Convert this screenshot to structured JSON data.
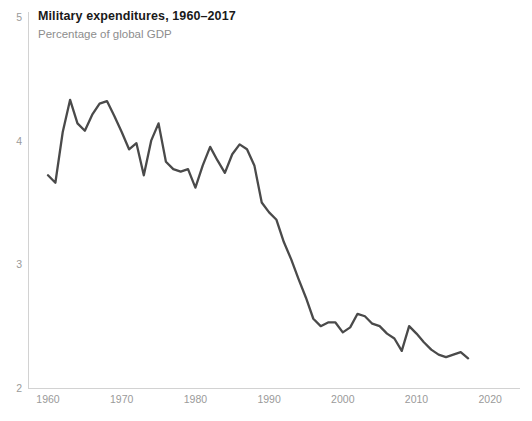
{
  "chart_data": {
    "type": "line",
    "title": "Military expenditures, 1960–2017",
    "subtitle": "Percentage of global GDP",
    "xlabel": "",
    "ylabel": "",
    "xlim": [
      1957,
      2022
    ],
    "ylim": [
      2,
      5
    ],
    "grid": false,
    "legend": null,
    "line_color": "#4a4a4a",
    "axis_color": "#d2d2d2",
    "tick_label_color": "#9a9a9a",
    "xticks": [
      1960,
      1970,
      1980,
      1990,
      2000,
      2010,
      2020
    ],
    "xtick_labels": [
      "1960",
      "1970",
      "1980",
      "1990",
      "2000",
      "2010",
      "2020"
    ],
    "yticks": [
      2,
      3,
      4,
      5
    ],
    "ytick_labels": [
      "2",
      "3",
      "4",
      "5"
    ],
    "series": [
      {
        "name": "Military expenditures (% of global GDP)",
        "x": [
          1960,
          1961,
          1962,
          1963,
          1964,
          1965,
          1966,
          1967,
          1968,
          1969,
          1970,
          1971,
          1972,
          1973,
          1974,
          1975,
          1976,
          1977,
          1978,
          1979,
          1980,
          1981,
          1982,
          1983,
          1984,
          1985,
          1986,
          1987,
          1988,
          1989,
          1990,
          1991,
          1992,
          1993,
          1994,
          1995,
          1996,
          1997,
          1998,
          1999,
          2000,
          2001,
          2002,
          2003,
          2004,
          2005,
          2006,
          2007,
          2008,
          2009,
          2010,
          2011,
          2012,
          2013,
          2014,
          2015,
          2016,
          2017
        ],
        "values": [
          3.72,
          3.66,
          4.07,
          4.33,
          4.14,
          4.08,
          4.21,
          4.3,
          4.32,
          4.2,
          4.07,
          3.93,
          3.98,
          3.72,
          4.0,
          4.14,
          3.83,
          3.77,
          3.75,
          3.77,
          3.62,
          3.8,
          3.95,
          3.84,
          3.74,
          3.89,
          3.97,
          3.93,
          3.8,
          3.5,
          3.42,
          3.36,
          3.18,
          3.04,
          2.88,
          2.73,
          2.56,
          2.5,
          2.53,
          2.53,
          2.45,
          2.49,
          2.6,
          2.58,
          2.52,
          2.5,
          2.44,
          2.4,
          2.3,
          2.5,
          2.44,
          2.37,
          2.31,
          2.27,
          2.25,
          2.27,
          2.29,
          2.24
        ]
      }
    ]
  },
  "axes": {
    "y_tick_0": "5",
    "y_tick_1": "4",
    "y_tick_2": "3",
    "y_tick_3": "2",
    "x_tick_0": "1960",
    "x_tick_1": "1970",
    "x_tick_2": "1980",
    "x_tick_3": "1990",
    "x_tick_4": "2000",
    "x_tick_5": "2010",
    "x_tick_6": "2020"
  },
  "footer": {
    "source": ""
  }
}
